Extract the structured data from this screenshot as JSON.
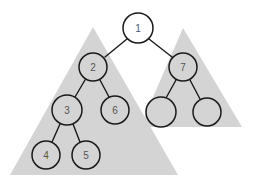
{
  "diagram": {
    "type": "binary-tree-subtrees",
    "colors": {
      "background": "#ffffff",
      "subtree_fill": "#d4d4d4",
      "root_fill": "#ffffff",
      "node_fill_in_subtree": "#d4d4d4",
      "stroke": "#1a1a1a",
      "label": "#555555"
    },
    "subtrees": [
      {
        "id": "left-subtree",
        "points": "93,27 10,175 178,175"
      },
      {
        "id": "right-subtree",
        "points": "183,28 140,127 242,127"
      }
    ],
    "nodes": [
      {
        "id": "n1",
        "label": "1",
        "cx": 138,
        "cy": 28,
        "r": 15,
        "in_subtree": false
      },
      {
        "id": "n2",
        "label": "2",
        "cx": 93,
        "cy": 67,
        "r": 14,
        "in_subtree": true
      },
      {
        "id": "n7",
        "label": "7",
        "cx": 183,
        "cy": 67,
        "r": 14,
        "in_subtree": true
      },
      {
        "id": "n3",
        "label": "3",
        "cx": 67,
        "cy": 110,
        "r": 15,
        "in_subtree": true
      },
      {
        "id": "n6",
        "label": "6",
        "cx": 115,
        "cy": 110,
        "r": 14,
        "in_subtree": true
      },
      {
        "id": "n7a",
        "label": "",
        "cx": 161,
        "cy": 112,
        "r": 15,
        "in_subtree": true
      },
      {
        "id": "n7b",
        "label": "",
        "cx": 207,
        "cy": 112,
        "r": 14,
        "in_subtree": true
      },
      {
        "id": "n4",
        "label": "4",
        "cx": 46,
        "cy": 155,
        "r": 14,
        "in_subtree": true
      },
      {
        "id": "n5",
        "label": "5",
        "cx": 86,
        "cy": 155,
        "r": 14,
        "in_subtree": true
      }
    ],
    "edges": [
      {
        "from": "n1",
        "to": "n2",
        "x1": 127,
        "y1": 39,
        "x2": 105,
        "y2": 57
      },
      {
        "from": "n1",
        "to": "n7",
        "x1": 149,
        "y1": 39,
        "x2": 172,
        "y2": 57
      },
      {
        "from": "n2",
        "to": "n3",
        "x1": 85,
        "y1": 80,
        "x2": 75,
        "y2": 97
      },
      {
        "from": "n2",
        "to": "n6",
        "x1": 100,
        "y1": 80,
        "x2": 109,
        "y2": 97
      },
      {
        "from": "n7",
        "to": "n7a",
        "x1": 176,
        "y1": 80,
        "x2": 166,
        "y2": 98
      },
      {
        "from": "n7",
        "to": "n7b",
        "x1": 190,
        "y1": 80,
        "x2": 200,
        "y2": 99
      },
      {
        "from": "n3",
        "to": "n4",
        "x1": 60,
        "y1": 124,
        "x2": 52,
        "y2": 142
      },
      {
        "from": "n3",
        "to": "n5",
        "x1": 73,
        "y1": 124,
        "x2": 80,
        "y2": 142
      }
    ]
  }
}
